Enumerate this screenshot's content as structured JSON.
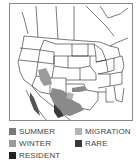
{
  "map": {
    "region": "North America (western/central US and Mexico)",
    "colors": {
      "border": "#1a1a1a",
      "summer": "#7a7a7a",
      "winter": "#9b9b9b",
      "migration": "#b3b3b3",
      "rare": "#3a3a3a",
      "resident": "#222222"
    }
  },
  "legend": {
    "items": [
      {
        "key": "summer",
        "label": "SUMMER",
        "color": "#7a7a7a"
      },
      {
        "key": "migration",
        "label": "MIGRATION",
        "color": "#b3b3b3"
      },
      {
        "key": "winter",
        "label": "WINTER",
        "color": "#9b9b9b"
      },
      {
        "key": "rare",
        "label": "RARE",
        "color": "#3a3a3a"
      },
      {
        "key": "resident",
        "label": "RESIDENT",
        "color": "#222222"
      }
    ]
  }
}
